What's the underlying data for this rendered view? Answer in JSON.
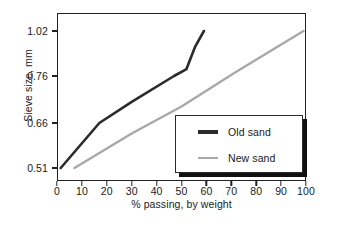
{
  "chart_data": {
    "type": "line",
    "title": "",
    "xlabel": "% passing, by weight",
    "ylabel": "Sieve size, mm",
    "xlim": [
      0,
      100
    ],
    "xticks": [
      0,
      10,
      20,
      30,
      40,
      50,
      60,
      70,
      80,
      90,
      100
    ],
    "xticklabels": [
      "0",
      "10",
      "20",
      "30",
      "40",
      "50",
      "60",
      "70",
      "80",
      "90",
      "100"
    ],
    "yticklabels": [
      "0.51",
      "0.66",
      "0.76",
      "1.02"
    ],
    "ytick_values": [
      0.51,
      0.66,
      0.76,
      1.02
    ],
    "ytick_positions_px": [
      168,
      123,
      76,
      31
    ],
    "grid": false,
    "legend_position": "lower-right-inside",
    "series": [
      {
        "name": "Old sand",
        "color": "#2b2b2b",
        "width": 2.6,
        "points": [
          {
            "x": 1.5,
            "y": 0.51
          },
          {
            "x": 17.0,
            "y": 0.66
          },
          {
            "x": 30.0,
            "y": 0.705
          },
          {
            "x": 47.0,
            "y": 0.76
          },
          {
            "x": 52.0,
            "y": 0.8
          },
          {
            "x": 55.5,
            "y": 0.93
          },
          {
            "x": 59.0,
            "y": 1.02
          }
        ]
      },
      {
        "name": "New sand",
        "color": "#a8a8a8",
        "width": 2.4,
        "points": [
          {
            "x": 7.0,
            "y": 0.51
          },
          {
            "x": 30.0,
            "y": 0.625
          },
          {
            "x": 50.0,
            "y": 0.695
          },
          {
            "x": 72.0,
            "y": 0.785
          },
          {
            "x": 99.0,
            "y": 1.02
          }
        ]
      }
    ]
  },
  "legend": {
    "entries": [
      {
        "label": "Old sand",
        "color": "#2b2b2b"
      },
      {
        "label": "New sand",
        "color": "#a8a8a8"
      }
    ]
  },
  "axes": {
    "y_title": "Sieve size, mm",
    "x_title": "% passing, by weight"
  },
  "caption": {
    "text": ""
  }
}
